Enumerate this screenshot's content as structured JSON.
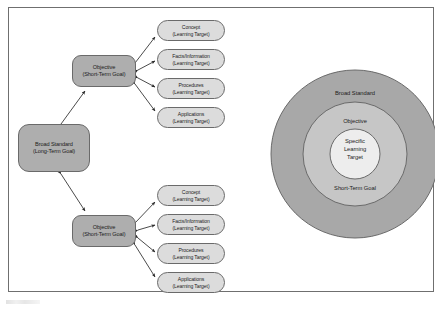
{
  "figure": {
    "border_color": "#6f6f6f",
    "background": "#ffffff"
  },
  "colors": {
    "block_fill": "#aeaeae",
    "pill_fill": "#dcdcdc",
    "outer_ring_fill": "#a8a8a8",
    "middle_ring_fill": "#c6c6c6",
    "inner_circle_fill": "#ededed",
    "stroke": "#6a6a6a",
    "arrow": "#2a2a2a",
    "text": "#1c1c1c"
  },
  "hierarchy": {
    "broad_standard": {
      "title": "Broad Standard",
      "subtitle": "(Long-Term Goal)"
    },
    "objective": {
      "title": "Objective",
      "subtitle": "(Short-Term Goal)"
    },
    "learning_target_subtitle": "(Learning Target)",
    "learning_targets": [
      "Concept",
      "Facts/Information",
      "Procedures",
      "Applications"
    ]
  },
  "branches": [
    {
      "id": "top",
      "objective_title": "Objective",
      "objective_subtitle": "(Short-Term Goal)",
      "targets": [
        {
          "title": "Concept",
          "subtitle": "(Learning Target)"
        },
        {
          "title": "Facts/Information",
          "subtitle": "(Learning Target)"
        },
        {
          "title": "Procedures",
          "subtitle": "(Learning Target)"
        },
        {
          "title": "Applications",
          "subtitle": "(Learning Target)"
        }
      ]
    },
    {
      "id": "bottom",
      "objective_title": "Objective",
      "objective_subtitle": "(Short-Term Goal)",
      "targets": [
        {
          "title": "Concept",
          "subtitle": "(Learning Target)"
        },
        {
          "title": "Facts/Information",
          "subtitle": "(Learning Target)"
        },
        {
          "title": "Procedures",
          "subtitle": "(Learning Target)"
        },
        {
          "title": "Applications",
          "subtitle": "(Learning Target)"
        }
      ]
    }
  ],
  "concentric": {
    "outer_label": "Broad Standard",
    "middle_label": "Objective",
    "middle_label_bottom": "Short-Term Goal",
    "inner_label_line1": "Specific",
    "inner_label_line2": "Learning",
    "inner_label_line3": "Target"
  }
}
